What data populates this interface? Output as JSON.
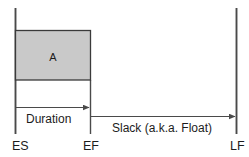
{
  "diagram": {
    "type": "schedule-float-diagram",
    "task_box": {
      "label": "A",
      "fill_color": "#c9c9c9",
      "stroke_color": "#3a3a3a"
    },
    "milestones": [
      {
        "id": "es",
        "label": "ES",
        "x": 15
      },
      {
        "id": "ef",
        "label": "EF",
        "x": 90
      },
      {
        "id": "lf",
        "label": "LF",
        "x": 236
      }
    ],
    "spans": [
      {
        "id": "duration",
        "label": "Duration",
        "from": "ES",
        "to": "EF"
      },
      {
        "id": "slack",
        "label": "Slack (a.k.a. Float)",
        "from": "EF",
        "to": "LF"
      }
    ],
    "line_color": "#4a4a4a",
    "text_color": "#1c1c1c"
  }
}
